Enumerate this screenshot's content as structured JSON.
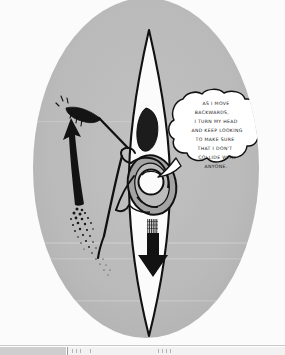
{
  "illustration": {
    "title": "kayaker-paddling-backwards",
    "background_color": "#fdfdfd",
    "oval_color": "#b9b9b9",
    "ink_color": "#111111",
    "hull_color": "#fbfbfb",
    "speech_bubble": {
      "lines": [
        "AS I MOVE",
        "BACKWARDS,",
        "I TURN MY HEAD",
        "AND KEEP LOOKING",
        "TO MAKE SURE",
        "THAT I DON'T",
        "COLLIDE WITH",
        "ANYONE."
      ],
      "fill_color": "#ffffff",
      "stroke_color": "#111111"
    },
    "labels": {
      "direction_arrow": "downward-travel-arrow",
      "recovery_arrow": "paddle-recovery-arrow",
      "paddle": "kayak-paddle",
      "kayak": "kayak-hull",
      "paddler": "kayaker-figure"
    }
  },
  "bottom_bar": {
    "visible": true,
    "left_segment_color": "#bdbdbd",
    "right_segment_color": "#f2f2f2"
  }
}
